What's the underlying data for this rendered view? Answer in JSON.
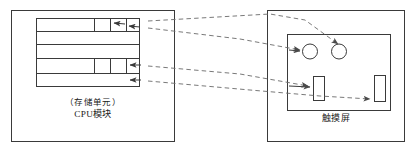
{
  "diagram": {
    "stroke_color": "#3a3a3a",
    "dash_color": "#6a6a6a",
    "background": "#ffffff"
  },
  "cpu_box": {
    "name": "CPU module box",
    "unit_label": "（存储单元）",
    "module_label": "CPU模块",
    "memory_rows": [
      {
        "index": 1,
        "dividers": [
          57,
          73,
          84
        ],
        "arrows": 2
      },
      {
        "index": 2,
        "dividers": [],
        "arrows": 0
      },
      {
        "index": 3,
        "dividers": [],
        "arrows": 0
      },
      {
        "index": 4,
        "dividers": [
          57,
          73,
          84
        ],
        "arrows": 1
      },
      {
        "index": 5,
        "dividers": [],
        "arrows": 1
      }
    ]
  },
  "touch_box": {
    "name": "Touch screen box",
    "label": "触摸屏",
    "widgets": [
      {
        "type": "circle",
        "id": "circle-1"
      },
      {
        "type": "circle",
        "id": "circle-2"
      },
      {
        "type": "rect",
        "id": "slider-1"
      },
      {
        "type": "rect",
        "id": "slider-2"
      }
    ]
  },
  "connectors": [
    {
      "id": "link-1",
      "from": "memory-row-1-cell-b",
      "to": "circle-2"
    },
    {
      "id": "link-2",
      "from": "memory-row-1-cell-a",
      "to": "circle-1"
    },
    {
      "id": "link-3",
      "from": "memory-row-4",
      "to": "slider-1"
    },
    {
      "id": "link-4",
      "from": "memory-row-5",
      "to": "slider-2"
    }
  ]
}
